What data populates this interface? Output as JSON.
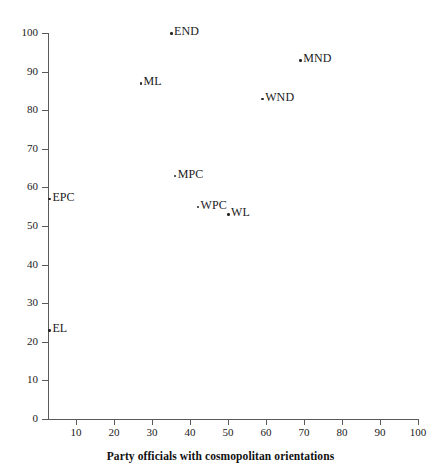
{
  "chart_data": {
    "type": "scatter",
    "title": "",
    "xlabel": "Party officials with cosmopolitan orientations",
    "ylabel": "",
    "xlim": [
      0,
      100
    ],
    "ylim": [
      0,
      100
    ],
    "grid": false,
    "legend": "none",
    "x_ticks": [
      10,
      20,
      30,
      40,
      50,
      60,
      70,
      80,
      90,
      100
    ],
    "y_ticks": [
      0,
      10,
      20,
      30,
      40,
      50,
      60,
      70,
      80,
      90,
      100
    ],
    "x_tick_labels": [
      "10",
      "20",
      "30",
      "40",
      "50",
      "60",
      "70",
      "80",
      "90",
      "100"
    ],
    "y_tick_labels": [
      "0",
      "10",
      "20",
      "30",
      "40",
      "50",
      "60",
      "70",
      "80",
      "90",
      "100"
    ],
    "points": [
      {
        "label": "END",
        "x": 35,
        "y": 100
      },
      {
        "label": "MND",
        "x": 69,
        "y": 93
      },
      {
        "label": "ML",
        "x": 27,
        "y": 87
      },
      {
        "label": "WND",
        "x": 59,
        "y": 83
      },
      {
        "label": "MPC",
        "x": 36,
        "y": 63
      },
      {
        "label": "EPC",
        "x": 3,
        "y": 57
      },
      {
        "label": "WPC",
        "x": 42,
        "y": 55
      },
      {
        "label": "WL",
        "x": 50,
        "y": 53
      },
      {
        "label": "EL",
        "x": 3,
        "y": 23
      }
    ],
    "colors": {
      "point": "#262626",
      "axis": "#5a5a5a",
      "text": "#1a1a1a",
      "background": "#ffffff"
    }
  }
}
